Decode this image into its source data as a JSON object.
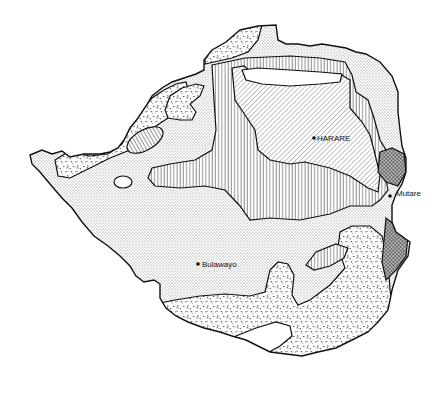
{
  "map": {
    "region": "Zimbabwe",
    "cities": [
      {
        "name": "HARARE",
        "x": 314,
        "y": 138
      },
      {
        "name": "Mutare",
        "x": 390,
        "y": 193
      },
      {
        "name": "Bulawayo",
        "x": 198,
        "y": 264
      }
    ],
    "zones": [
      {
        "id": "fine-dot",
        "pattern": "fine stipple (light grey)"
      },
      {
        "id": "coarse-dot",
        "pattern": "coarse random stipple"
      },
      {
        "id": "vertical",
        "pattern": "vertical lines"
      },
      {
        "id": "diagonal",
        "pattern": "diagonal hatching"
      },
      {
        "id": "crosshatch",
        "pattern": "dense cross-hatch (dark)"
      },
      {
        "id": "blank",
        "pattern": "white / unshaded"
      }
    ],
    "colors": {
      "ink": "#111111",
      "background": "#ffffff"
    }
  }
}
